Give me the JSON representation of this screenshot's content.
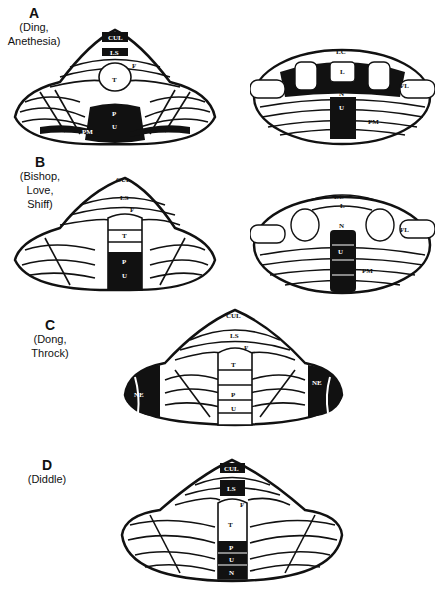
{
  "figure": {
    "panels": [
      {
        "letter": "A",
        "authors_line1": "(Ding,",
        "authors_line2": "Anethesia)",
        "dorsal_labels": {
          "cul": "CUL",
          "ls": "LS",
          "f": "F",
          "t": "T",
          "p": "P",
          "u": "U",
          "pm": "PM"
        },
        "ventral_labels": {
          "lc": "LC",
          "l": "L",
          "n": "N",
          "u": "U",
          "fl": "FL",
          "pm": "PM"
        }
      },
      {
        "letter": "B",
        "authors_line1": "(Bishop,",
        "authors_line2": "Love,",
        "authors_line3": "Shiff)",
        "dorsal_labels": {
          "cul": "CUL",
          "ls": "LS",
          "f": "F",
          "t": "T",
          "p": "P",
          "u": "U"
        },
        "ventral_labels": {
          "lc": "LC",
          "l": "L",
          "n": "N",
          "u": "U",
          "fl": "FL",
          "pm": "PM"
        }
      },
      {
        "letter": "C",
        "authors_line1": "(Dong,",
        "authors_line2": "Throck)",
        "dorsal_labels": {
          "cul": "CUL",
          "ls": "LS",
          "f": "F",
          "t": "T",
          "p": "P",
          "u": "U",
          "ne_left": "NE",
          "ne_right": "NE"
        }
      },
      {
        "letter": "D",
        "authors_line1": "(Diddle)",
        "dorsal_labels": {
          "cul": "CUL",
          "ls": "LS",
          "f": "F",
          "t": "T",
          "p": "P",
          "u": "U",
          "n": "N"
        }
      }
    ],
    "colors": {
      "ink": "#111111",
      "paper": "#ffffff"
    }
  }
}
